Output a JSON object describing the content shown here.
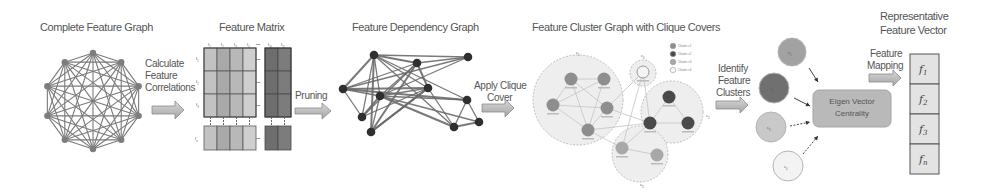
{
  "titles": {
    "complete_graph": "Complete Feature Graph",
    "feature_matrix": "Feature Matrix",
    "dependency_graph": "Feature Dependency Graph",
    "cluster_graph": "Feature Cluster Graph with Clique Covers",
    "representative_vector_line1": "Representative",
    "representative_vector_line2": "Feature Vector"
  },
  "steps": {
    "calculate": [
      "Calculate",
      "Feature",
      "Correlations"
    ],
    "pruning": [
      "Pruning"
    ],
    "clique_cover": [
      "Apply Clique",
      "Cover"
    ],
    "identify": [
      "Identify",
      "Feature",
      "Clusters"
    ],
    "mapping": [
      "Feature",
      "Mapping"
    ]
  },
  "matrix": {
    "col_labels": [
      "f1",
      "f2",
      "f3",
      "f4",
      "f10",
      "f11"
    ],
    "row_labels": [
      "f1",
      "f2",
      "f3",
      "fn"
    ],
    "ellipsis": "•••"
  },
  "clusters": {
    "labels": [
      "c1",
      "c2",
      "c3",
      "c4"
    ],
    "legend": [
      "Cluster c1",
      "Cluster c2",
      "Cluster c3",
      "Cluster c4"
    ],
    "colors": [
      "#8e8e8e",
      "#4a4a4a",
      "#a8a8a8",
      "#f4f4f4"
    ]
  },
  "centrality": {
    "line1": "Eigen Vector",
    "line2": "Centrality",
    "inputs": [
      "c1",
      "c2",
      "c3",
      "c4"
    ]
  },
  "vector": {
    "entries": [
      "f1",
      "f2",
      "f3",
      "fn"
    ]
  }
}
